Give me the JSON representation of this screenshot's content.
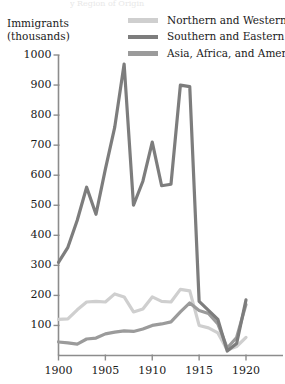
{
  "figure": {
    "name": "immigration-line-chart",
    "cropped_title": "y Region of Origin"
  },
  "axis": {
    "y_title": "Immigrants\n(thousands)",
    "y_ticks": [
      "1000",
      "900",
      "800",
      "700",
      "600",
      "500",
      "400",
      "300",
      "200",
      "100"
    ],
    "x_ticks": [
      "1900",
      "1905",
      "1910",
      "1915",
      "1920"
    ]
  },
  "legend": [
    {
      "label": "Northern and Western Europe",
      "color": "#cfcfcf",
      "icon": "legend-line-swatch"
    },
    {
      "label": "Southern and Eastern Europe",
      "color": "#7d7d7d",
      "icon": "legend-line-swatch"
    },
    {
      "label": "Asia, Africa, and America",
      "color": "#9b9b9b",
      "icon": "legend-line-swatch"
    }
  ],
  "chart_data": {
    "type": "line",
    "xlabel": "",
    "ylabel": "Immigrants (thousands)",
    "xlim": [
      1900,
      1921
    ],
    "ylim": [
      0,
      1050
    ],
    "grid": false,
    "legend_position": "top-right",
    "x": [
      1900,
      1901,
      1902,
      1903,
      1904,
      1905,
      1906,
      1907,
      1908,
      1909,
      1910,
      1911,
      1912,
      1913,
      1914,
      1915,
      1916,
      1917,
      1918,
      1919,
      1920
    ],
    "series": [
      {
        "name": "Northern and Western Europe",
        "color": "#cfcfcf",
        "values": [
          120,
          122,
          152,
          178,
          180,
          178,
          205,
          195,
          145,
          155,
          195,
          180,
          178,
          220,
          215,
          100,
          92,
          75,
          18,
          30,
          60
        ]
      },
      {
        "name": "Southern and Eastern Europe",
        "color": "#7d7d7d",
        "values": [
          310,
          360,
          450,
          560,
          470,
          620,
          760,
          970,
          500,
          580,
          710,
          565,
          570,
          900,
          895,
          180,
          150,
          120,
          15,
          40,
          185
        ]
      },
      {
        "name": "Asia, Africa, and America",
        "color": "#9b9b9b",
        "values": [
          45,
          42,
          38,
          55,
          58,
          72,
          78,
          82,
          80,
          88,
          100,
          105,
          112,
          145,
          175,
          150,
          140,
          105,
          25,
          60,
          170
        ]
      }
    ]
  }
}
